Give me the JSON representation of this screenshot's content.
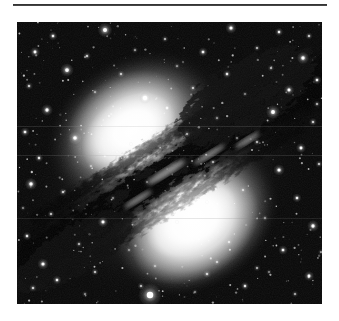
{
  "page": {
    "background_color": "#ffffff",
    "width": 339,
    "height": 321
  },
  "rule": {
    "name": "top-horizontal-rule",
    "color": "#1e1e1e",
    "x": 13,
    "y": 4,
    "width": 314,
    "height": 2
  },
  "figure": {
    "name": "astronomy-photograph",
    "palette": "grayscale",
    "x": 17,
    "y": 22,
    "width": 305,
    "height": 282,
    "background_color": "#050505",
    "alt": "Black and white photograph of an elliptical galaxy crossed by a broad dark dust lane, set against a dense field of foreground stars."
  },
  "chart_data": {
    "type": "scatter",
    "title": "",
    "xlabel": "",
    "ylabel": "",
    "xlim": [
      0,
      305
    ],
    "ylim": [
      0,
      282
    ],
    "grid": false,
    "legend": "none",
    "background": "#050505",
    "glow_sources": [
      {
        "name": "upper-bulge",
        "cx": 118,
        "cy": 108,
        "rx": 92,
        "ry": 74,
        "rotation": -34,
        "peak": "#ffffff"
      },
      {
        "name": "lower-bulge",
        "cx": 176,
        "cy": 196,
        "rx": 84,
        "ry": 68,
        "rotation": -34,
        "peak": "#ffffff"
      },
      {
        "name": "outer-halo",
        "cx": 148,
        "cy": 152,
        "rx": 148,
        "ry": 124,
        "rotation": -34,
        "peak": "#bdbdbd"
      }
    ],
    "dust_lane": {
      "angle_deg": -32,
      "center": [
        150,
        152
      ],
      "length": 300,
      "thickness": 54,
      "color": "#141414",
      "description": "broad mottled absorption band from lower-left to upper-right"
    },
    "stars": [
      {
        "x": 88,
        "y": 8,
        "r": 2.6,
        "b": 1.0
      },
      {
        "x": 214,
        "y": 6,
        "r": 2.0,
        "b": 0.9
      },
      {
        "x": 262,
        "y": 10,
        "r": 1.5,
        "b": 0.8
      },
      {
        "x": 36,
        "y": 14,
        "r": 1.6,
        "b": 0.8
      },
      {
        "x": 148,
        "y": 17,
        "r": 1.2,
        "b": 0.6
      },
      {
        "x": 292,
        "y": 14,
        "r": 1.3,
        "b": 0.7
      },
      {
        "x": 18,
        "y": 30,
        "r": 1.8,
        "b": 0.85
      },
      {
        "x": 70,
        "y": 34,
        "r": 1.4,
        "b": 0.7
      },
      {
        "x": 118,
        "y": 28,
        "r": 1.1,
        "b": 0.55
      },
      {
        "x": 186,
        "y": 30,
        "r": 1.7,
        "b": 0.8
      },
      {
        "x": 240,
        "y": 26,
        "r": 1.2,
        "b": 0.6
      },
      {
        "x": 286,
        "y": 36,
        "r": 2.2,
        "b": 0.95
      },
      {
        "x": 50,
        "y": 48,
        "r": 2.4,
        "b": 0.95
      },
      {
        "x": 104,
        "y": 52,
        "r": 1.3,
        "b": 0.65
      },
      {
        "x": 160,
        "y": 44,
        "r": 1.1,
        "b": 0.5
      },
      {
        "x": 210,
        "y": 52,
        "r": 1.5,
        "b": 0.75
      },
      {
        "x": 254,
        "y": 46,
        "r": 1.2,
        "b": 0.6
      },
      {
        "x": 300,
        "y": 58,
        "r": 1.6,
        "b": 0.8
      },
      {
        "x": 12,
        "y": 64,
        "r": 1.4,
        "b": 0.7
      },
      {
        "x": 78,
        "y": 70,
        "r": 1.1,
        "b": 0.55
      },
      {
        "x": 128,
        "y": 76,
        "r": 2.8,
        "b": 1.0
      },
      {
        "x": 176,
        "y": 66,
        "r": 1.3,
        "b": 0.65
      },
      {
        "x": 228,
        "y": 72,
        "r": 1.0,
        "b": 0.5
      },
      {
        "x": 272,
        "y": 68,
        "r": 1.9,
        "b": 0.88
      },
      {
        "x": 30,
        "y": 88,
        "r": 2.1,
        "b": 0.9
      },
      {
        "x": 92,
        "y": 94,
        "r": 1.2,
        "b": 0.6
      },
      {
        "x": 150,
        "y": 86,
        "r": 1.5,
        "b": 0.7
      },
      {
        "x": 200,
        "y": 96,
        "r": 1.1,
        "b": 0.5
      },
      {
        "x": 256,
        "y": 90,
        "r": 2.5,
        "b": 0.95
      },
      {
        "x": 296,
        "y": 100,
        "r": 1.4,
        "b": 0.7
      },
      {
        "x": 8,
        "y": 110,
        "r": 1.7,
        "b": 0.8
      },
      {
        "x": 58,
        "y": 116,
        "r": 2.3,
        "b": 0.92
      },
      {
        "x": 114,
        "y": 122,
        "r": 1.0,
        "b": 0.5
      },
      {
        "x": 170,
        "y": 112,
        "r": 1.2,
        "b": 0.55
      },
      {
        "x": 240,
        "y": 120,
        "r": 1.3,
        "b": 0.6
      },
      {
        "x": 284,
        "y": 126,
        "r": 1.8,
        "b": 0.85
      },
      {
        "x": 22,
        "y": 136,
        "r": 1.5,
        "b": 0.75
      },
      {
        "x": 74,
        "y": 144,
        "r": 1.1,
        "b": 0.5
      },
      {
        "x": 196,
        "y": 140,
        "r": 1.2,
        "b": 0.55
      },
      {
        "x": 262,
        "y": 148,
        "r": 2.0,
        "b": 0.9
      },
      {
        "x": 302,
        "y": 142,
        "r": 1.3,
        "b": 0.65
      },
      {
        "x": 14,
        "y": 162,
        "r": 2.2,
        "b": 0.9
      },
      {
        "x": 46,
        "y": 170,
        "r": 1.4,
        "b": 0.7
      },
      {
        "x": 96,
        "y": 176,
        "r": 1.0,
        "b": 0.5
      },
      {
        "x": 226,
        "y": 168,
        "r": 1.2,
        "b": 0.6
      },
      {
        "x": 280,
        "y": 176,
        "r": 1.6,
        "b": 0.8
      },
      {
        "x": 34,
        "y": 192,
        "r": 1.3,
        "b": 0.65
      },
      {
        "x": 86,
        "y": 200,
        "r": 1.9,
        "b": 0.85
      },
      {
        "x": 248,
        "y": 196,
        "r": 1.1,
        "b": 0.55
      },
      {
        "x": 296,
        "y": 204,
        "r": 2.1,
        "b": 0.9
      },
      {
        "x": 10,
        "y": 214,
        "r": 1.5,
        "b": 0.75
      },
      {
        "x": 62,
        "y": 222,
        "r": 1.2,
        "b": 0.6
      },
      {
        "x": 112,
        "y": 228,
        "r": 1.0,
        "b": 0.5
      },
      {
        "x": 212,
        "y": 220,
        "r": 1.3,
        "b": 0.6
      },
      {
        "x": 266,
        "y": 228,
        "r": 1.7,
        "b": 0.8
      },
      {
        "x": 26,
        "y": 242,
        "r": 2.0,
        "b": 0.88
      },
      {
        "x": 78,
        "y": 250,
        "r": 1.3,
        "b": 0.65
      },
      {
        "x": 138,
        "y": 244,
        "r": 1.1,
        "b": 0.5
      },
      {
        "x": 190,
        "y": 252,
        "r": 1.4,
        "b": 0.7
      },
      {
        "x": 240,
        "y": 246,
        "r": 1.2,
        "b": 0.55
      },
      {
        "x": 292,
        "y": 254,
        "r": 1.8,
        "b": 0.85
      },
      {
        "x": 16,
        "y": 266,
        "r": 1.4,
        "b": 0.7
      },
      {
        "x": 68,
        "y": 272,
        "r": 1.1,
        "b": 0.5
      },
      {
        "x": 124,
        "y": 264,
        "r": 1.3,
        "b": 0.6
      },
      {
        "x": 178,
        "y": 270,
        "r": 1.0,
        "b": 0.5
      },
      {
        "x": 228,
        "y": 264,
        "r": 1.5,
        "b": 0.75
      },
      {
        "x": 278,
        "y": 272,
        "r": 1.2,
        "b": 0.55
      },
      {
        "x": 40,
        "y": 258,
        "r": 1.6,
        "b": 0.78
      },
      {
        "x": 133,
        "y": 273,
        "r": 4.2,
        "b": 1.0
      },
      {
        "x": 200,
        "y": 240,
        "r": 1.2,
        "b": 0.6
      },
      {
        "x": 160,
        "y": 200,
        "r": 1.0,
        "b": 0.5
      },
      {
        "x": 190,
        "y": 180,
        "r": 0.9,
        "b": 0.45
      },
      {
        "x": 130,
        "y": 160,
        "r": 0.9,
        "b": 0.45
      },
      {
        "x": 220,
        "y": 116,
        "r": 1.0,
        "b": 0.5
      },
      {
        "x": 100,
        "y": 130,
        "r": 0.8,
        "b": 0.4
      },
      {
        "x": 252,
        "y": 250,
        "r": 1.0,
        "b": 0.5
      },
      {
        "x": 304,
        "y": 230,
        "r": 1.1,
        "b": 0.55
      },
      {
        "x": 6,
        "y": 186,
        "r": 1.0,
        "b": 0.5
      },
      {
        "x": 300,
        "y": 82,
        "r": 1.2,
        "b": 0.6
      }
    ]
  }
}
